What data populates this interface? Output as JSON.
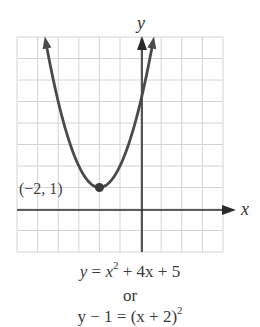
{
  "graph": {
    "axis_labels": {
      "x": "x",
      "y": "y"
    },
    "grid": {
      "x_min": -6,
      "x_max": 4,
      "y_min": -2,
      "y_max": 8,
      "step": 1
    },
    "vertex": {
      "x": -2,
      "y": 1,
      "label": "(−2, 1)"
    },
    "curve": {
      "type": "parabola",
      "a": 1,
      "h": -2,
      "k": 1
    },
    "colors": {
      "grid": "#d4d4d4",
      "axes": "#2a2a2a",
      "curve": "#4a4a4a",
      "text": "#333333"
    }
  },
  "equations": {
    "standard": {
      "lhs": "y",
      "eq": " = ",
      "x": "x",
      "exp": "2",
      "rest": " + 4x + 5"
    },
    "connector": "or",
    "vertex_form": {
      "lhs": "y − 1 = (x + 2)",
      "exp": "2"
    }
  }
}
